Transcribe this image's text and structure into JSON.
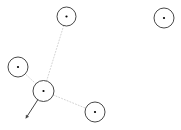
{
  "canvas": {
    "width": 181,
    "height": 130,
    "background_color": "#ffffff"
  },
  "style": {
    "node_stroke_color": "#333333",
    "node_fill_color": "#ffffff",
    "node_center_dot_color": "#000000",
    "edge_color": "#c8c8c8",
    "vector_color": "#444444",
    "node_stroke_width": 0.9,
    "edge_stroke_width": 0.8,
    "edge_dash": "1,2",
    "vector_stroke_width": 1.0
  },
  "chart_data": {
    "type": "scatter",
    "title": "",
    "xlabel": "",
    "ylabel": "",
    "xlim": [
      0,
      181
    ],
    "ylim": [
      0,
      130
    ],
    "grid": false,
    "legend": "none",
    "nodes": [
      {
        "id": "n1",
        "label": "",
        "x": 66.5,
        "y": 16.5,
        "r": 9.5,
        "selected": false
      },
      {
        "id": "n2",
        "label": "",
        "x": 164,
        "y": 18,
        "r": 10,
        "selected": false
      },
      {
        "id": "n3",
        "label": "",
        "x": 18,
        "y": 67,
        "r": 10,
        "selected": false
      },
      {
        "id": "n4",
        "label": "",
        "x": 43.5,
        "y": 91,
        "r": 10.5,
        "selected": true
      },
      {
        "id": "n5",
        "label": "",
        "x": 95,
        "y": 112,
        "r": 10,
        "selected": false
      }
    ],
    "edges": [
      {
        "from": "n4",
        "to": "n1",
        "style": "dotted"
      },
      {
        "from": "n4",
        "to": "n3",
        "style": "dotted"
      },
      {
        "from": "n4",
        "to": "n5",
        "style": "dotted"
      }
    ],
    "vectors": [
      {
        "from_node": "n4",
        "x1": 43.5,
        "y1": 91,
        "x2": 26,
        "y2": 118,
        "arrowhead": "filled"
      }
    ]
  }
}
